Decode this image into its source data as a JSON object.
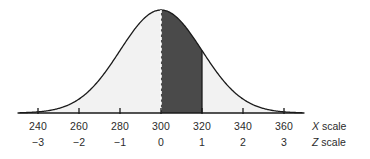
{
  "chart_data": {
    "type": "area",
    "title": "",
    "subtitle": "",
    "xlabel": "",
    "ylabel": "",
    "grid": false,
    "legend_position": "right",
    "distribution": "normal",
    "mean_x": 300,
    "sd_x": 20,
    "peak_z": 0,
    "axis_x_range": [
      235,
      365
    ],
    "axis_z_range": [
      -3.25,
      3.25
    ],
    "shaded_region": {
      "label": "",
      "z_from": 0,
      "z_to": 1,
      "x_from": 300,
      "x_to": 320,
      "fill_color": "#4a4a4a"
    },
    "unshaded_fill_color": "#f2f2f2",
    "curve_color": "#1a1a1a",
    "axis_color": "#1a1a1a",
    "center_line": {
      "z": 0,
      "x": 300,
      "style": "dashed",
      "color": "#ffffff"
    },
    "boundary_line": {
      "z": 1,
      "x": 320,
      "style": "solid",
      "color": "#1a1a1a"
    },
    "ticks": [
      {
        "x_label": "240",
        "z_label": "−3",
        "z": -3
      },
      {
        "x_label": "260",
        "z_label": "−2",
        "z": -2
      },
      {
        "x_label": "280",
        "z_label": "−1",
        "z": -1
      },
      {
        "x_label": "300",
        "z_label": "0",
        "z": 0
      },
      {
        "x_label": "320",
        "z_label": "1",
        "z": 1
      },
      {
        "x_label": "340",
        "z_label": "2",
        "z": 2
      },
      {
        "x_label": "360",
        "z_label": "3",
        "z": 3
      }
    ],
    "x_scale_symbol": "X",
    "x_scale_word": "scale",
    "z_scale_symbol": "Z",
    "z_scale_word": "scale"
  }
}
